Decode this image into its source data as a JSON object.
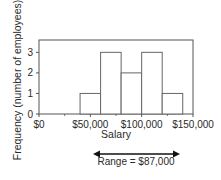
{
  "chart_data": {
    "type": "bar",
    "subtype": "histogram",
    "title": "",
    "xlabel": "Salary",
    "ylabel": "Frequency (number of employees)",
    "bins": [
      {
        "start": 40000,
        "end": 60000,
        "count": 1
      },
      {
        "start": 60000,
        "end": 80000,
        "count": 3
      },
      {
        "start": 80000,
        "end": 100000,
        "count": 2
      },
      {
        "start": 100000,
        "end": 120000,
        "count": 3
      },
      {
        "start": 120000,
        "end": 140000,
        "count": 1
      }
    ],
    "categories": [
      "$40,000–$60,000",
      "$60,000–$80,000",
      "$80,000–$100,000",
      "$100,000–$120,000",
      "$120,000–$140,000"
    ],
    "values": [
      1,
      3,
      2,
      3,
      1
    ],
    "xlim": [
      0,
      150000
    ],
    "ylim": [
      0,
      3.6
    ],
    "x_ticks": [
      0,
      50000,
      100000,
      150000
    ],
    "x_tick_labels": [
      "$0",
      "$50,000",
      "$100,000",
      "$150,000"
    ],
    "y_ticks": [
      0,
      1,
      2,
      3
    ],
    "y_tick_labels": [
      "0",
      "1",
      "2",
      "3"
    ],
    "grid": false,
    "legend": null,
    "annotations": [
      {
        "type": "double-arrow",
        "from_x": 53000,
        "to_x": 140000,
        "label": "Range = $87,000"
      }
    ]
  },
  "labels": {
    "ylabel": "Frequency (number of employees)",
    "xlabel": "Salary",
    "range": "Range = $87,000"
  },
  "colors": {
    "axis": "#555555",
    "bar_stroke": "#666666",
    "bar_fill": "#ffffff",
    "arrow": "#111111",
    "text": "#2a2a2a"
  }
}
